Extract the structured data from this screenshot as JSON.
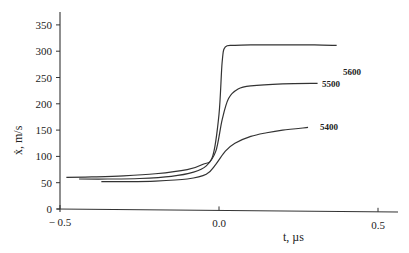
{
  "chart_data": {
    "type": "line",
    "title": "",
    "xlabel": "t, µs",
    "ylabel": "ẋ, m/s",
    "xlim": [
      -0.5,
      0.55
    ],
    "ylim": [
      0,
      370
    ],
    "x_ticks": [
      -0.5,
      0.0,
      0.5
    ],
    "x_tick_labels": [
      "− 0.5",
      "0.0",
      "0.5"
    ],
    "y_ticks": [
      0,
      50,
      100,
      150,
      200,
      250,
      300,
      350
    ],
    "y_tick_labels": [
      "0",
      "50",
      "100",
      "150",
      "200",
      "250",
      "300",
      "350"
    ],
    "grid": false,
    "legend": "inline labels at right end of each curve",
    "series": [
      {
        "name": "5600",
        "x": [
          -0.48,
          -0.4,
          -0.3,
          -0.2,
          -0.1,
          -0.05,
          -0.02,
          0.0,
          0.01,
          0.02,
          0.05,
          0.1,
          0.2,
          0.3,
          0.37
        ],
        "values": [
          60,
          61,
          63,
          67,
          75,
          85,
          100,
          180,
          280,
          308,
          311,
          312,
          312,
          312,
          311
        ]
      },
      {
        "name": "5500",
        "x": [
          -0.44,
          -0.35,
          -0.25,
          -0.15,
          -0.08,
          -0.04,
          -0.01,
          0.01,
          0.03,
          0.06,
          0.1,
          0.2,
          0.31
        ],
        "values": [
          57,
          57,
          58,
          62,
          70,
          82,
          110,
          170,
          210,
          228,
          234,
          238,
          239
        ]
      },
      {
        "name": "5400",
        "x": [
          -0.37,
          -0.3,
          -0.2,
          -0.1,
          -0.04,
          -0.01,
          0.02,
          0.05,
          0.1,
          0.15,
          0.2,
          0.28
        ],
        "values": [
          52,
          52,
          53,
          57,
          66,
          85,
          110,
          125,
          138,
          145,
          150,
          155
        ]
      }
    ]
  },
  "labels": {
    "ylabel_text": "ẋ, m/s",
    "xlabel_text": "t, µs",
    "series_5600": "5600",
    "series_5500": "5500",
    "series_5400": "5400"
  }
}
